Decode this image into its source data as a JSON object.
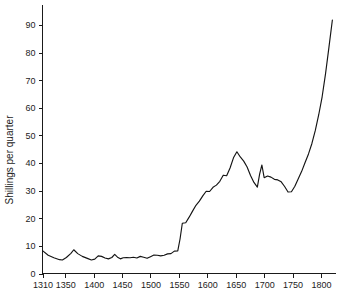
{
  "chart_data": {
    "type": "line",
    "title": "",
    "subtitle": "",
    "xlabel": "",
    "ylabel": "Shillings per quarter",
    "xlim": [
      1310,
      1822
    ],
    "ylim": [
      0,
      95
    ],
    "grid": false,
    "legend": null,
    "xticks": [
      1310,
      1350,
      1400,
      1450,
      1500,
      1550,
      1600,
      1650,
      1700,
      1750,
      1800
    ],
    "xtick_labels": [
      "1310",
      "1350",
      "1400",
      "1450",
      "1500",
      "1550",
      "1600",
      "1650",
      "1700",
      "1750",
      "1800"
    ],
    "yticks": [
      0,
      10,
      20,
      30,
      40,
      50,
      60,
      70,
      80,
      90
    ],
    "ytick_labels": [
      "0",
      "10",
      "20",
      "30",
      "40",
      "50",
      "60",
      "70",
      "80",
      "90"
    ],
    "series": [
      {
        "name": "Shillings per quarter",
        "color": "#141414",
        "x": [
          1310,
          1320,
          1330,
          1340,
          1345,
          1352,
          1360,
          1365,
          1372,
          1380,
          1390,
          1396,
          1402,
          1408,
          1414,
          1420,
          1426,
          1432,
          1437,
          1442,
          1447,
          1452,
          1458,
          1464,
          1470,
          1476,
          1482,
          1488,
          1494,
          1500,
          1506,
          1512,
          1518,
          1524,
          1530,
          1536,
          1542,
          1548,
          1552,
          1556,
          1562,
          1568,
          1574,
          1580,
          1586,
          1592,
          1598,
          1604,
          1610,
          1616,
          1622,
          1628,
          1634,
          1640,
          1646,
          1652,
          1658,
          1664,
          1670,
          1676,
          1682,
          1688,
          1692,
          1696,
          1700,
          1706,
          1712,
          1718,
          1724,
          1730,
          1736,
          1742,
          1748,
          1754,
          1760,
          1766,
          1772,
          1778,
          1784,
          1790,
          1796,
          1802,
          1808,
          1814,
          1820
        ],
        "y": [
          8.3,
          6.6,
          5.7,
          5.0,
          4.9,
          5.8,
          7.3,
          8.6,
          7.2,
          6.2,
          5.4,
          4.9,
          5.2,
          6.4,
          6.2,
          5.6,
          5.3,
          5.8,
          6.9,
          5.9,
          5.3,
          5.7,
          5.8,
          5.7,
          5.9,
          5.6,
          6.2,
          5.9,
          5.5,
          6.1,
          6.7,
          6.6,
          6.4,
          6.6,
          7.1,
          7.2,
          8.1,
          8.2,
          12.5,
          18.2,
          18.4,
          20.4,
          22.6,
          24.7,
          26.2,
          28.1,
          29.8,
          29.7,
          31.2,
          32.0,
          33.4,
          35.6,
          35.4,
          38.2,
          41.9,
          44.1,
          42.2,
          40.7,
          38.6,
          35.5,
          33.0,
          31.3,
          36.0,
          39.3,
          34.7,
          35.3,
          34.9,
          34.1,
          33.9,
          33.2,
          31.5,
          29.5,
          29.6,
          31.6,
          34.3,
          37.0,
          40.2,
          43.3,
          47.1,
          51.8,
          57.5,
          64.0,
          72.4,
          82.0,
          91.8
        ]
      }
    ],
    "annotations": []
  },
  "axes": {
    "ylabel": "Shillings per quarter"
  }
}
